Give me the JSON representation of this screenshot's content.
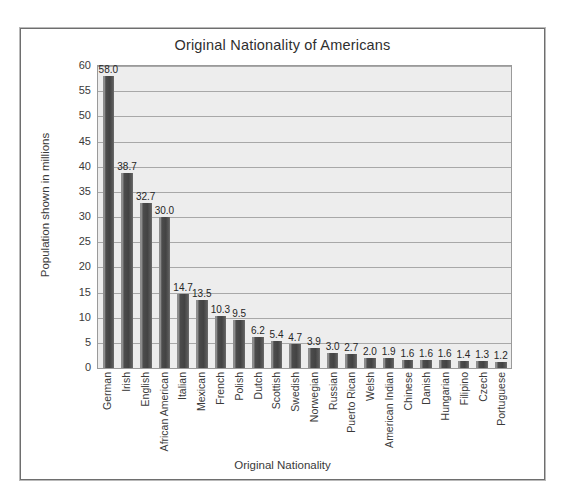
{
  "chart_data": {
    "type": "bar",
    "title": "Original Nationality of Americans",
    "xlabel": "Original Nationality",
    "ylabel": "Population shown in millions",
    "ylim": [
      0,
      60
    ],
    "ytick_step": 5,
    "yticks": [
      "60",
      "55",
      "50",
      "45",
      "40",
      "35",
      "30",
      "25",
      "20",
      "15",
      "10",
      "5",
      "0"
    ],
    "grid": true,
    "legend": false,
    "categories": [
      "German",
      "Irish",
      "English",
      "African American",
      "Italian",
      "Mexican",
      "French",
      "Polish",
      "Dutch",
      "Scottish",
      "Swedish",
      "Norwegian",
      "Russian",
      "Puerto Rican",
      "Welsh",
      "American Indian",
      "Chinese",
      "Danish",
      "Hungarian",
      "Filipino",
      "Czech",
      "Portuguese"
    ],
    "values": [
      58.0,
      38.7,
      32.7,
      30.0,
      14.7,
      13.5,
      10.3,
      9.5,
      6.2,
      5.4,
      4.7,
      3.9,
      3.0,
      2.7,
      2.0,
      1.9,
      1.6,
      1.6,
      1.6,
      1.4,
      1.3,
      1.2
    ],
    "value_labels": [
      "58.0",
      "38.7",
      "32.7",
      "30.0",
      "14.7",
      "13.5",
      "10.3",
      "9.5",
      "6.2",
      "5.4",
      "4.7",
      "3.9",
      "3.0",
      "2.7",
      "2.0",
      "1.9",
      "1.6",
      "1.6",
      "1.6",
      "1.4",
      "1.3",
      "1.2"
    ],
    "colors": {
      "bar": "#4c4c4c",
      "bar_highlight": "#8d8d8d",
      "plot_background": "#ededed",
      "gridline": "#a8a8a8",
      "frame": "#6e6e6e",
      "text": "#3a3a3a"
    }
  }
}
